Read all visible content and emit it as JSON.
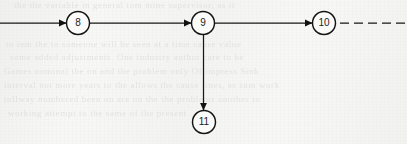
{
  "figure": {
    "kind": "directed-graph",
    "background_color": "#f7f7f5",
    "ink_color": "#171717",
    "width": 407,
    "height": 144,
    "ghost_text": [
      {
        "text": "the the variable in general tom mine supervisor, as it",
        "x": 14,
        "y": 6,
        "size": 9
      },
      {
        "text": "to tem the to someone will be seen at a time cause value",
        "x": 6,
        "y": 45,
        "size": 9
      },
      {
        "text": "some added adjustments. One industry author     care to be",
        "x": 10,
        "y": 58,
        "size": 9
      },
      {
        "text": "Games   nominal the on   and the problem   only    Of   impress      Sink",
        "x": 4,
        "y": 72,
        "size": 9
      },
      {
        "text": "interval  not  more   years   to the allows   the cause  lines, as sum work",
        "x": 4,
        "y": 86,
        "size": 9
      },
      {
        "text": "tollway   numbered been   on    are    on  the   the   problems  another to",
        "x": 4,
        "y": 100,
        "size": 9
      },
      {
        "text": "working   attempt       to       the       same      of       the      present",
        "x": 8,
        "y": 114,
        "size": 9
      }
    ]
  },
  "graph": {
    "nodes": [
      {
        "id": "8",
        "label": "8",
        "cx": 78,
        "cy": 23,
        "r": 11.5
      },
      {
        "id": "9",
        "label": "9",
        "cx": 203,
        "cy": 23,
        "r": 11.5
      },
      {
        "id": "10",
        "label": "10",
        "cx": 324,
        "cy": 23,
        "r": 11.5
      },
      {
        "id": "11",
        "label": "11",
        "cx": 204,
        "cy": 122,
        "r": 11.5
      }
    ],
    "edges": [
      {
        "id": "edge-in-to-8",
        "from": "(off-page left)",
        "to": "8",
        "style": "solid",
        "arrow": "to"
      },
      {
        "id": "edge-8-to-9",
        "from": "8",
        "to": "9",
        "style": "solid",
        "arrow": "to"
      },
      {
        "id": "edge-9-to-10",
        "from": "9",
        "to": "10",
        "style": "solid",
        "arrow": "to"
      },
      {
        "id": "edge-9-to-11",
        "from": "9",
        "to": "11",
        "style": "solid",
        "arrow": "to"
      },
      {
        "id": "edge-10-onward",
        "from": "10",
        "to": "(continues off-page right)",
        "style": "dashed",
        "arrow": "none"
      }
    ]
  }
}
